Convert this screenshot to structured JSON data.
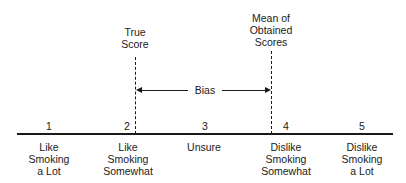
{
  "diagram": {
    "markers": {
      "true_score": {
        "label_line1": "True",
        "label_line2": "Score"
      },
      "mean_obtained": {
        "label_line1": "Mean of",
        "label_line2": "Obtained",
        "label_line3": "Scores"
      }
    },
    "bias": {
      "label": "Bias"
    },
    "scale": [
      {
        "number": "1",
        "line1": "Like",
        "line2": "Smoking",
        "line3": "a Lot"
      },
      {
        "number": "2",
        "line1": "Like",
        "line2": "Smoking",
        "line3": "Somewhat"
      },
      {
        "number": "3",
        "line1": "Unsure",
        "line2": "",
        "line3": ""
      },
      {
        "number": "4",
        "line1": "Dislike",
        "line2": "Smoking",
        "line3": "Somewhat"
      },
      {
        "number": "5",
        "line1": "Dislike",
        "line2": "Smoking",
        "line3": "a Lot"
      }
    ]
  }
}
